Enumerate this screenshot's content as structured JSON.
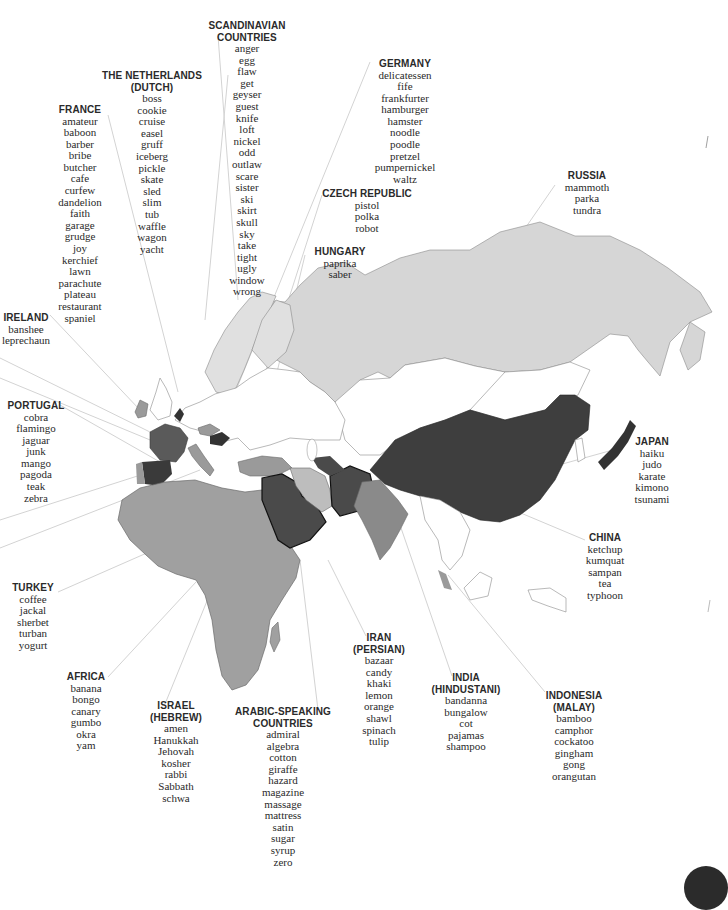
{
  "colors": {
    "background": "#ffffff",
    "light": "#d6d6d6",
    "medium": "#9a9a9a",
    "dark": "#4a4a4a",
    "darkest": "#333333",
    "leader": "#d0d0d0",
    "text": "#2a2a2a"
  },
  "regions": [
    {
      "id": "scandinavia",
      "title": [
        "SCANDINAVIAN",
        "COUNTRIES"
      ],
      "x": 247,
      "y": 20,
      "words": [
        "anger",
        "egg",
        "flaw",
        "get",
        "geyser",
        "guest",
        "knife",
        "loft",
        "nickel",
        "odd",
        "outlaw",
        "scare",
        "sister",
        "ski",
        "skirt",
        "skull",
        "sky",
        "take",
        "tight",
        "ugly",
        "window",
        "wrong"
      ]
    },
    {
      "id": "netherlands",
      "title": [
        "THE NETHERLANDS",
        "(DUTCH)"
      ],
      "x": 152,
      "y": 70,
      "words": [
        "boss",
        "cookie",
        "cruise",
        "easel",
        "gruff",
        "iceberg",
        "pickle",
        "skate",
        "sled",
        "slim",
        "tub",
        "waffle",
        "wagon",
        "yacht"
      ]
    },
    {
      "id": "france",
      "title": [
        "FRANCE"
      ],
      "x": 80,
      "y": 104,
      "words": [
        "amateur",
        "baboon",
        "barber",
        "bribe",
        "butcher",
        "cafe",
        "curfew",
        "dandelion",
        "faith",
        "garage",
        "grudge",
        "joy",
        "kerchief",
        "lawn",
        "parachute",
        "plateau",
        "restaurant",
        "spaniel"
      ]
    },
    {
      "id": "ireland",
      "title": [
        "IRELAND"
      ],
      "x": 26,
      "y": 312,
      "words": [
        "banshee",
        "leprechaun"
      ]
    },
    {
      "id": "portugal",
      "title": [
        "PORTUGAL"
      ],
      "x": 36,
      "y": 400,
      "words": [
        "cobra",
        "flamingo",
        "jaguar",
        "junk",
        "mango",
        "pagoda",
        "teak",
        "zebra"
      ]
    },
    {
      "id": "germany",
      "title": [
        "GERMANY"
      ],
      "x": 405,
      "y": 58,
      "words": [
        "delicatessen",
        "fife",
        "frankfurter",
        "hamburger",
        "hamster",
        "noodle",
        "poodle",
        "pretzel",
        "pumpernickel",
        "waltz"
      ]
    },
    {
      "id": "czech",
      "title": [
        "CZECH REPUBLIC"
      ],
      "x": 367,
      "y": 188,
      "words": [
        "pistol",
        "polka",
        "robot"
      ]
    },
    {
      "id": "hungary",
      "title": [
        "HUNGARY"
      ],
      "x": 340,
      "y": 246,
      "words": [
        "paprika",
        "saber"
      ]
    },
    {
      "id": "russia",
      "title": [
        "RUSSIA"
      ],
      "x": 587,
      "y": 170,
      "words": [
        "mammoth",
        "parka",
        "tundra"
      ]
    },
    {
      "id": "japan",
      "title": [
        "JAPAN"
      ],
      "x": 652,
      "y": 436,
      "words": [
        "haiku",
        "judo",
        "karate",
        "kimono",
        "tsunami"
      ]
    },
    {
      "id": "china",
      "title": [
        "CHINA"
      ],
      "x": 605,
      "y": 532,
      "words": [
        "ketchup",
        "kumquat",
        "sampan",
        "tea",
        "typhoon"
      ]
    },
    {
      "id": "turkey",
      "title": [
        "TURKEY"
      ],
      "x": 33,
      "y": 582,
      "words": [
        "coffee",
        "jackal",
        "sherbet",
        "turban",
        "yogurt"
      ]
    },
    {
      "id": "africa",
      "title": [
        "AFRICA"
      ],
      "x": 86,
      "y": 671,
      "words": [
        "banana",
        "bongo",
        "canary",
        "gumbo",
        "okra",
        "yam"
      ]
    },
    {
      "id": "israel",
      "title": [
        "ISRAEL",
        "(HEBREW)"
      ],
      "x": 176,
      "y": 700,
      "words": [
        "amen",
        "Hanukkah",
        "Jehovah",
        "kosher",
        "rabbi",
        "Sabbath",
        "schwa"
      ]
    },
    {
      "id": "arabic",
      "title": [
        "ARABIC-SPEAKING",
        "COUNTRIES"
      ],
      "x": 283,
      "y": 706,
      "words": [
        "admiral",
        "algebra",
        "cotton",
        "giraffe",
        "hazard",
        "magazine",
        "massage",
        "mattress",
        "satin",
        "sugar",
        "syrup",
        "zero"
      ]
    },
    {
      "id": "iran",
      "title": [
        "IRAN",
        "(PERSIAN)"
      ],
      "x": 379,
      "y": 632,
      "words": [
        "bazaar",
        "candy",
        "khaki",
        "lemon",
        "orange",
        "shawl",
        "spinach",
        "tulip"
      ]
    },
    {
      "id": "india",
      "title": [
        "INDIA",
        "(HINDUSTANI)"
      ],
      "x": 466,
      "y": 672,
      "words": [
        "bandanna",
        "bungalow",
        "cot",
        "pajamas",
        "shampoo"
      ]
    },
    {
      "id": "indonesia",
      "title": [
        "INDONESIA",
        "(MALAY)"
      ],
      "x": 574,
      "y": 690,
      "words": [
        "bamboo",
        "camphor",
        "cockatoo",
        "gingham",
        "gong",
        "orangutan"
      ]
    }
  ]
}
